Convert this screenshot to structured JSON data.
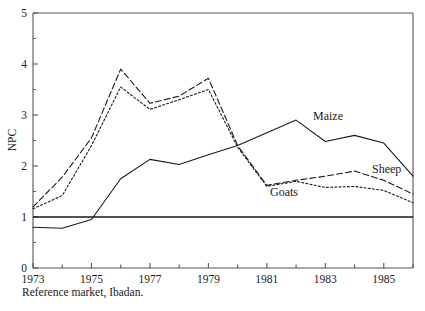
{
  "caption": "Reference market, Ibadan.",
  "chart_data": {
    "type": "line",
    "title": "",
    "xlabel": "",
    "ylabel": "NPC",
    "xlim": [
      1973,
      1986
    ],
    "ylim": [
      0,
      5
    ],
    "grid": false,
    "legend": "inline-annotations",
    "x": [
      1973,
      1974,
      1975,
      1976,
      1977,
      1978,
      1979,
      1980,
      1981,
      1982,
      1983,
      1984,
      1985,
      1986
    ],
    "x_tick_labels": [
      "1973",
      "1975",
      "1977",
      "1979",
      "1981",
      "1983",
      "1985"
    ],
    "x_tick_values": [
      1973,
      1975,
      1977,
      1979,
      1981,
      1983,
      1985
    ],
    "y_tick_labels": [
      "0",
      "1",
      "2",
      "3",
      "4",
      "5"
    ],
    "y_tick_values": [
      0,
      1,
      2,
      3,
      4,
      5
    ],
    "y_minor_tick_values": [
      0.5,
      1.5,
      2.5,
      3.5,
      4.5
    ],
    "reference_line": {
      "value": 1,
      "label": "NPC = 1"
    },
    "series": [
      {
        "name": "Maize",
        "style": "solid",
        "values": [
          0.8,
          0.78,
          0.95,
          1.75,
          2.13,
          2.03,
          2.22,
          2.4,
          2.65,
          2.9,
          2.48,
          2.6,
          2.45,
          1.8
        ]
      },
      {
        "name": "Sheep",
        "style": "dashed",
        "values": [
          1.2,
          1.78,
          2.55,
          3.9,
          3.23,
          3.37,
          3.72,
          2.4,
          1.62,
          1.72,
          1.8,
          1.9,
          1.72,
          1.45
        ]
      },
      {
        "name": "Goats",
        "style": "dotted",
        "values": [
          1.16,
          1.42,
          2.4,
          3.55,
          3.11,
          3.3,
          3.5,
          2.37,
          1.6,
          1.7,
          1.58,
          1.6,
          1.52,
          1.28
        ]
      }
    ]
  },
  "series_labels": [
    {
      "name": "Maize",
      "x": 313,
      "y": 120
    },
    {
      "name": "Sheep",
      "x": 372,
      "y": 173
    },
    {
      "name": "Goats",
      "x": 270,
      "y": 196
    }
  ],
  "colors": {
    "line": "#1a1a1a",
    "axis": "#555555",
    "background": "#ffffff"
  }
}
